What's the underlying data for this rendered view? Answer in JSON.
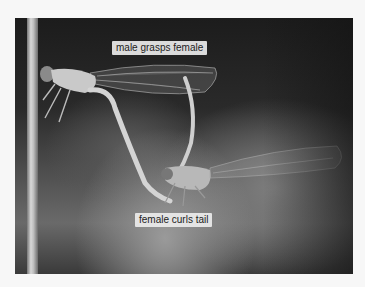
{
  "image": {
    "subject": "Damselfly mating pair on a plant stem",
    "labels": {
      "top": "male grasps female",
      "bottom": "female curls tail"
    }
  }
}
